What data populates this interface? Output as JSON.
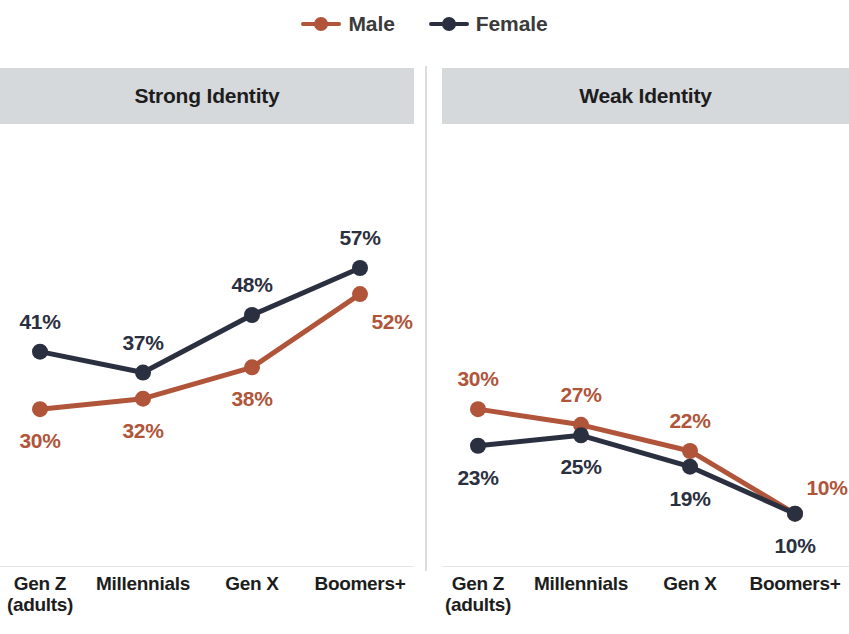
{
  "legend": {
    "items": [
      {
        "label": "Male",
        "color": "#b05539",
        "icon": "line-dot-marker"
      },
      {
        "label": "Female",
        "color": "#2b3040",
        "icon": "line-dot-marker"
      }
    ]
  },
  "panels": [
    {
      "id": "strong",
      "title": "Strong Identity"
    },
    {
      "id": "weak",
      "title": "Weak Identity"
    }
  ],
  "categories": [
    {
      "line1": "Gen Z",
      "line2": "(adults)"
    },
    {
      "line1": "Millennials",
      "line2": ""
    },
    {
      "line1": "Gen X",
      "line2": ""
    },
    {
      "line1": "Boomers+",
      "line2": ""
    }
  ],
  "chart_data": [
    {
      "type": "line",
      "title": "Strong Identity",
      "categories": [
        "Gen Z (adults)",
        "Millennials",
        "Gen X",
        "Boomers+"
      ],
      "series": [
        {
          "name": "Male",
          "color": "#b05539",
          "values": [
            30,
            32,
            38,
            52
          ],
          "labels": [
            "30%",
            "32%",
            "38%",
            "52%"
          ],
          "label_positions": [
            "below",
            "below",
            "below",
            "below-right"
          ]
        },
        {
          "name": "Female",
          "color": "#2b3040",
          "values": [
            41,
            37,
            48,
            57
          ],
          "labels": [
            "41%",
            "37%",
            "48%",
            "57%"
          ],
          "label_positions": [
            "above",
            "above",
            "above",
            "above"
          ]
        }
      ],
      "xlabel": "",
      "ylabel": "",
      "ylim": [
        0,
        70
      ],
      "grid": false,
      "legend_position": "top-center",
      "value_unit": "%"
    },
    {
      "type": "line",
      "title": "Weak Identity",
      "categories": [
        "Gen Z (adults)",
        "Millennials",
        "Gen X",
        "Boomers+"
      ],
      "series": [
        {
          "name": "Male",
          "color": "#b05539",
          "values": [
            30,
            27,
            22,
            10
          ],
          "labels": [
            "30%",
            "27%",
            "22%",
            "10%"
          ],
          "label_positions": [
            "above",
            "above",
            "above",
            "above-right"
          ]
        },
        {
          "name": "Female",
          "color": "#2b3040",
          "values": [
            23,
            25,
            19,
            10
          ],
          "labels": [
            "23%",
            "25%",
            "19%",
            "10%"
          ],
          "label_positions": [
            "below",
            "below",
            "below",
            "below"
          ]
        }
      ],
      "xlabel": "",
      "ylabel": "",
      "ylim": [
        0,
        70
      ],
      "grid": false,
      "legend_position": "top-center",
      "value_unit": "%"
    }
  ],
  "colors": {
    "male": "#b05539",
    "female": "#2b3040",
    "header_band": "#d6d9dc",
    "divider": "#dcdcdc",
    "text": "#1d1d1d",
    "background": "#ffffff"
  }
}
